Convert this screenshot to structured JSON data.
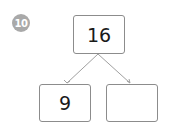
{
  "problem": {
    "number": "10",
    "badge_color": "#a9a9a9"
  },
  "number_bond": {
    "whole": "16",
    "parts": [
      "9",
      ""
    ]
  },
  "colors": {
    "box_border": "#8c8c8c",
    "connector_line": "#a0a0a0",
    "text": "#1a1a1a"
  }
}
